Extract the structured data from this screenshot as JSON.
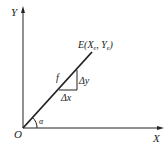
{
  "diagram": {
    "axes": {
      "x_label": "X",
      "y_label": "Y",
      "origin_label": "O"
    },
    "line": {
      "end_label": "E(X",
      "end_sub_x": "e",
      "end_mid": ", Y",
      "end_sub_y": "e",
      "end_close": ")",
      "function_label": "f",
      "angle_label": "α"
    },
    "triangle": {
      "dx_label": "Δx",
      "dy_label": "Δy"
    },
    "colors": {
      "stroke": "#222222",
      "background": "#ffffff"
    }
  }
}
